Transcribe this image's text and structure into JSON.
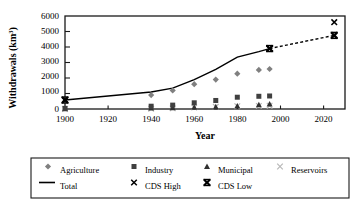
{
  "chart_data": {
    "type": "scatter",
    "title": "",
    "xlabel": "Year",
    "ylabel": "Withdrawals (km3)",
    "ylabel_base": "Withdrawals (km",
    "ylabel_sup": "3",
    "ylabel_close": ")",
    "xlim": [
      1900,
      2030
    ],
    "ylim": [
      0,
      6000
    ],
    "xticks": [
      1900,
      1920,
      1940,
      1960,
      1980,
      2000,
      2020
    ],
    "yticks": [
      0,
      1000,
      2000,
      3000,
      4000,
      5000,
      6000
    ],
    "grid": false,
    "legend_position": "below-plot",
    "series": [
      {
        "name": "Agriculture",
        "marker": "diamond",
        "color": "#808080",
        "x": [
          1900,
          1940,
          1950,
          1960,
          1970,
          1980,
          1990,
          1995
        ],
        "values": [
          500,
          900,
          1200,
          1600,
          1900,
          2280,
          2520,
          2580
        ]
      },
      {
        "name": "Industry",
        "marker": "square",
        "color": "#404040",
        "x": [
          1900,
          1940,
          1950,
          1960,
          1970,
          1980,
          1990,
          1995
        ],
        "values": [
          40,
          180,
          250,
          400,
          550,
          760,
          820,
          840
        ]
      },
      {
        "name": "Municipal",
        "marker": "triangle",
        "color": "#303030",
        "x": [
          1900,
          1940,
          1950,
          1960,
          1970,
          1980,
          1990,
          1995
        ],
        "values": [
          20,
          60,
          80,
          110,
          140,
          200,
          280,
          320
        ]
      },
      {
        "name": "Reservoirs",
        "marker": "x-light",
        "color": "#b8b8b8",
        "x": [
          1900,
          1940,
          1950,
          1960,
          1970,
          1980,
          1990,
          1995
        ],
        "values": [
          0,
          20,
          40,
          100,
          140,
          180,
          200,
          210
        ]
      },
      {
        "name": "Total",
        "marker": "line",
        "color": "#000000",
        "x": [
          1900,
          1940,
          1950,
          1960,
          1970,
          1980,
          1990,
          1995
        ],
        "values": [
          580,
          1100,
          1350,
          1900,
          2550,
          3350,
          3700,
          3900
        ]
      },
      {
        "name": "CDS High",
        "marker": "x",
        "color": "#000000",
        "x": [
          1900,
          1995,
          2025
        ],
        "values": [
          580,
          3900,
          5600
        ]
      },
      {
        "name": "CDS Low",
        "marker": "x-bold",
        "color": "#000000",
        "x": [
          1900,
          1995,
          2025
        ],
        "values": [
          580,
          3900,
          4750
        ]
      }
    ],
    "projection": {
      "style": "dashed",
      "from_x": 1995,
      "from_y": 3900,
      "to_x": 2025,
      "to_y": 4750
    }
  },
  "legend": {
    "entries": [
      {
        "label": "Agriculture",
        "marker": "diamond"
      },
      {
        "label": "Industry",
        "marker": "square"
      },
      {
        "label": "Municipal",
        "marker": "triangle"
      },
      {
        "label": "Reservoirs",
        "marker": "x-light"
      },
      {
        "label": "Total",
        "marker": "line"
      },
      {
        "label": "CDS High",
        "marker": "x"
      },
      {
        "label": "CDS Low",
        "marker": "x-bold"
      }
    ]
  }
}
